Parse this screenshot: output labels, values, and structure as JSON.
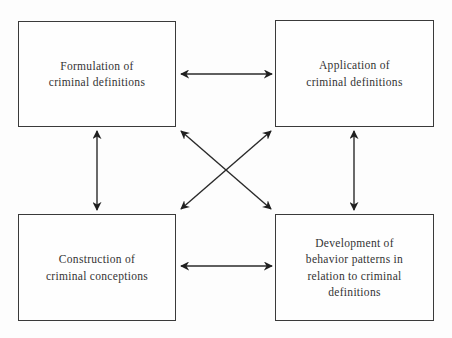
{
  "diagram": {
    "type": "bidirectional-relationship-diagram",
    "nodes": [
      {
        "id": "formulation",
        "label": "Formulation of\ncriminal definitions",
        "lines": [
          "Formulation of",
          "criminal definitions"
        ],
        "position": "top-left"
      },
      {
        "id": "application",
        "label": "Application of\ncriminal definitions",
        "lines": [
          "Application of",
          "criminal definitions"
        ],
        "position": "top-right"
      },
      {
        "id": "construction",
        "label": "Construction of\ncriminal conceptions",
        "lines": [
          "Construction of",
          "criminal conceptions"
        ],
        "position": "bottom-left"
      },
      {
        "id": "development",
        "label": "Development of\nbehavior patterns in\nrelation to criminal\ndefinitions",
        "lines": [
          "Development of",
          "behavior patterns in",
          "relation to criminal",
          "definitions"
        ],
        "position": "bottom-right"
      }
    ],
    "edges": [
      {
        "from": "formulation",
        "to": "application",
        "direction": "both"
      },
      {
        "from": "construction",
        "to": "development",
        "direction": "both"
      },
      {
        "from": "formulation",
        "to": "construction",
        "direction": "both"
      },
      {
        "from": "application",
        "to": "development",
        "direction": "both"
      },
      {
        "from": "formulation",
        "to": "development",
        "direction": "both"
      },
      {
        "from": "application",
        "to": "construction",
        "direction": "both"
      }
    ],
    "colors": {
      "background": "#fdfdfd",
      "stroke": "#2a2a2a",
      "text": "#333333"
    }
  }
}
